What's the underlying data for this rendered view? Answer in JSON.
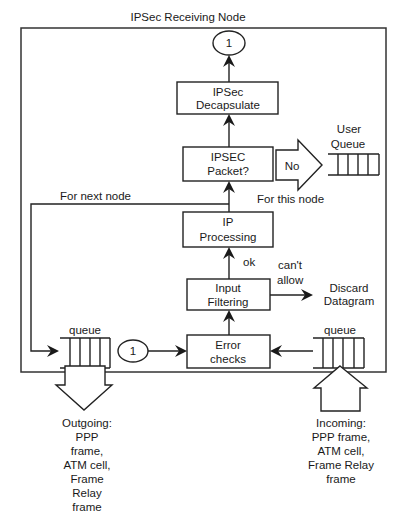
{
  "title": "IPSec Receiving Node",
  "nodes": {
    "connector_top": "1",
    "decapsulate": [
      "IPSec",
      "Decapsulate"
    ],
    "ipsec_packet": [
      "IPSEC",
      "Packet?"
    ],
    "ip_processing": [
      "IP",
      "Processing"
    ],
    "input_filtering": [
      "Input",
      "Filtering"
    ],
    "error_checks": [
      "Error",
      "checks"
    ],
    "connector_bottom": "1"
  },
  "labels": {
    "no": "No",
    "user": "User",
    "queue_user": "Queue",
    "for_next_node": "For next node",
    "for_this_node": "For this node",
    "ok": "ok",
    "cant": "can't",
    "allow": "allow",
    "discard": [
      "Discard",
      "Datagram"
    ],
    "queue_left": "queue",
    "queue_right": "queue",
    "outgoing": [
      "Outgoing:",
      "PPP",
      "frame,",
      "ATM cell,",
      "Frame",
      "Relay",
      "frame"
    ],
    "incoming": [
      "Incoming:",
      "PPP frame,",
      "ATM cell,",
      "Frame Relay",
      "frame"
    ]
  }
}
